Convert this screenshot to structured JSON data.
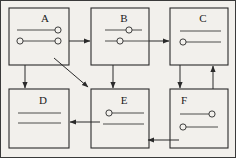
{
  "diagram": {
    "background_color": "#f2f0ec",
    "ink_color": "#2a2a2a",
    "boxes": [
      {
        "id": "A",
        "label": "A",
        "label_align": "center",
        "x": 9,
        "y": 8,
        "w": 60,
        "h": 57,
        "rows": [
          {
            "left_circle": false,
            "right_circle": true,
            "extends_right": false
          },
          {
            "left_circle": true,
            "right_circle": true,
            "extends_right": true
          }
        ]
      },
      {
        "id": "B",
        "label": "B",
        "label_align": "center",
        "x": 91,
        "y": 8,
        "w": 58,
        "h": 57,
        "rows": [
          {
            "mid_circle": true,
            "extends_right": false
          },
          {
            "mid_left_circle": true,
            "extends_right": true
          }
        ]
      },
      {
        "id": "C",
        "label": "C",
        "label_align": "center",
        "x": 170,
        "y": 8,
        "w": 58,
        "h": 57,
        "rows": [
          {
            "plain": true
          },
          {
            "left_circle": true
          }
        ]
      },
      {
        "id": "D",
        "label": "D",
        "label_align": "center",
        "x": 9,
        "y": 89,
        "w": 60,
        "h": 59,
        "rows": [
          {
            "plain": true
          },
          {
            "plain": true
          }
        ]
      },
      {
        "id": "E",
        "label": "E",
        "label_align": "center",
        "x": 91,
        "y": 89,
        "w": 58,
        "h": 59,
        "rows": [
          {
            "left_circle": true
          },
          {
            "plain": true
          }
        ]
      },
      {
        "id": "F",
        "label": "F",
        "label_align": "left",
        "x": 170,
        "y": 89,
        "w": 58,
        "h": 59,
        "rows": [
          {
            "right_circle": true
          },
          {
            "left_circle": true
          }
        ]
      }
    ],
    "connectors": [
      {
        "name": "a-to-b",
        "from": "A",
        "to": "B",
        "direction": "right"
      },
      {
        "name": "b-to-c",
        "from": "B",
        "to": "C",
        "direction": "right"
      },
      {
        "name": "a-to-d",
        "from": "A",
        "to": "D",
        "direction": "down"
      },
      {
        "name": "a-to-e",
        "from": "A",
        "to": "E",
        "direction": "diagonal-down-right"
      },
      {
        "name": "b-to-e",
        "from": "B",
        "to": "E",
        "direction": "down"
      },
      {
        "name": "c-to-f",
        "from": "C",
        "to": "F",
        "direction": "down"
      },
      {
        "name": "f-to-c",
        "from": "F",
        "to": "C",
        "direction": "up"
      },
      {
        "name": "e-to-d",
        "from": "E",
        "to": "D",
        "direction": "left"
      },
      {
        "name": "f-to-e",
        "from": "F",
        "to": "E",
        "direction": "left"
      }
    ]
  }
}
